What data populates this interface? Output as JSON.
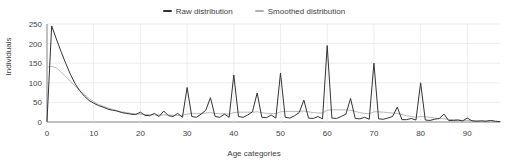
{
  "chart_data": {
    "type": "line",
    "title": "",
    "xlabel": "Age categories",
    "ylabel": "Individuals",
    "xlim": [
      0,
      97
    ],
    "ylim": [
      0,
      250
    ],
    "grid": true,
    "legend_position": "top-center",
    "xticks": [
      0,
      10,
      20,
      30,
      40,
      50,
      60,
      70,
      80,
      90
    ],
    "yticks": [
      0,
      50,
      100,
      150,
      200,
      250
    ],
    "colors": {
      "raw": "#333333",
      "smoothed": "#b0b0b0",
      "grid": "#e8e8e8",
      "axis": "#5f6368",
      "background": "#ffffff"
    },
    "series": [
      {
        "name": "Raw distribution",
        "color": "#333333",
        "x": [
          0,
          1,
          2,
          3,
          4,
          5,
          6,
          7,
          8,
          9,
          10,
          11,
          12,
          13,
          14,
          15,
          16,
          17,
          18,
          19,
          20,
          21,
          22,
          23,
          24,
          25,
          26,
          27,
          28,
          29,
          30,
          31,
          32,
          33,
          34,
          35,
          36,
          37,
          38,
          39,
          40,
          41,
          42,
          43,
          44,
          45,
          46,
          47,
          48,
          49,
          50,
          51,
          52,
          53,
          54,
          55,
          56,
          57,
          58,
          59,
          60,
          61,
          62,
          63,
          64,
          65,
          66,
          67,
          68,
          69,
          70,
          71,
          72,
          73,
          74,
          75,
          76,
          77,
          78,
          79,
          80,
          81,
          82,
          83,
          84,
          85,
          86,
          87,
          88,
          89,
          90,
          91,
          92,
          93,
          94,
          95,
          96,
          97
        ],
        "values": [
          2,
          245,
          212,
          180,
          150,
          122,
          98,
          80,
          66,
          55,
          48,
          42,
          38,
          33,
          30,
          28,
          24,
          22,
          20,
          19,
          25,
          17,
          16,
          22,
          14,
          28,
          16,
          14,
          22,
          12,
          88,
          14,
          12,
          20,
          30,
          62,
          14,
          12,
          20,
          12,
          120,
          14,
          12,
          18,
          26,
          74,
          12,
          11,
          18,
          10,
          125,
          12,
          10,
          16,
          24,
          56,
          10,
          9,
          14,
          8,
          195,
          10,
          9,
          14,
          20,
          60,
          9,
          8,
          12,
          7,
          150,
          8,
          7,
          10,
          14,
          38,
          6,
          6,
          9,
          5,
          100,
          5,
          4,
          7,
          9,
          20,
          4,
          4,
          5,
          3,
          10,
          3,
          2,
          3,
          2,
          4,
          2,
          1
        ]
      },
      {
        "name": "Smoothed distribution",
        "color": "#b0b0b0",
        "x": [
          0,
          1,
          2,
          3,
          4,
          5,
          6,
          7,
          8,
          9,
          10,
          11,
          12,
          13,
          14,
          15,
          16,
          17,
          18,
          19,
          20,
          21,
          22,
          23,
          24,
          25,
          26,
          27,
          28,
          29,
          30,
          31,
          32,
          33,
          34,
          35,
          36,
          37,
          38,
          39,
          40,
          41,
          42,
          43,
          44,
          45,
          46,
          47,
          48,
          49,
          50,
          51,
          52,
          53,
          54,
          55,
          56,
          57,
          58,
          59,
          60,
          61,
          62,
          63,
          64,
          65,
          66,
          67,
          68,
          69,
          70,
          71,
          72,
          73,
          74,
          75,
          76,
          77,
          78,
          79,
          80,
          81,
          82,
          83,
          84,
          85,
          86,
          87,
          88,
          89,
          90,
          91,
          92,
          93,
          94,
          95,
          96,
          97
        ],
        "values": [
          140,
          142,
          138,
          128,
          116,
          104,
          92,
          80,
          70,
          60,
          52,
          45,
          40,
          36,
          32,
          29,
          26,
          24,
          22,
          21,
          20,
          19,
          19,
          18,
          18,
          18,
          18,
          17,
          17,
          17,
          20,
          22,
          22,
          22,
          23,
          24,
          22,
          21,
          21,
          20,
          24,
          25,
          25,
          25,
          25,
          26,
          24,
          22,
          22,
          21,
          26,
          27,
          27,
          27,
          27,
          28,
          26,
          24,
          23,
          23,
          30,
          31,
          31,
          31,
          31,
          30,
          27,
          24,
          22,
          21,
          26,
          26,
          25,
          24,
          23,
          22,
          19,
          16,
          14,
          12,
          14,
          13,
          12,
          10,
          9,
          8,
          7,
          6,
          5,
          4,
          4,
          3,
          3,
          2,
          2,
          2,
          1,
          1
        ]
      }
    ]
  }
}
